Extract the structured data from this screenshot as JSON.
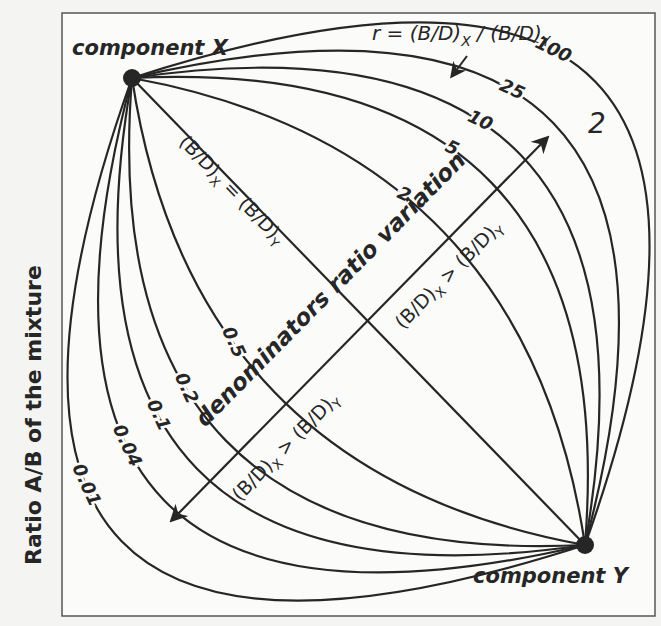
{
  "figure": {
    "panel_number": "2",
    "y_axis_label": "Ratio A/B of the mixture",
    "endmembers": {
      "x": {
        "label": "component X",
        "px": [
          132,
          78
        ]
      },
      "y": {
        "label": "component Y",
        "px": [
          585,
          545
        ]
      }
    },
    "formula": {
      "prefix": "r = (B/D)",
      "sub1": "X",
      "middle": " / (B/D)",
      "sub2": "Y"
    },
    "diagonal_axis_label": "denominators ratio variation",
    "equality_label": {
      "main": "(B/D)",
      "sub1": "X",
      "mid": " = (B/D)",
      "sub2": "Y"
    },
    "upper_region_label": {
      "main": "(B/D)",
      "sub1": "X",
      "mid": " > (B/D)",
      "sub2": "Y"
    },
    "lower_region_label": {
      "main": "(B/D)",
      "sub1": "X",
      "mid": " > (B/D)",
      "sub2": "Y"
    },
    "colors": {
      "ink": "#262626",
      "background": "#f4f4f2",
      "frame": "#555555"
    }
  },
  "curves": {
    "r_values": [
      100,
      25,
      10,
      5,
      2,
      1,
      0.5,
      0.2,
      0.1,
      0.04,
      0.01
    ],
    "labels": [
      "100",
      "25",
      "10",
      "5",
      "2",
      "",
      "0.5",
      "0.2",
      "0.1",
      "0.04",
      "0.01"
    ]
  }
}
